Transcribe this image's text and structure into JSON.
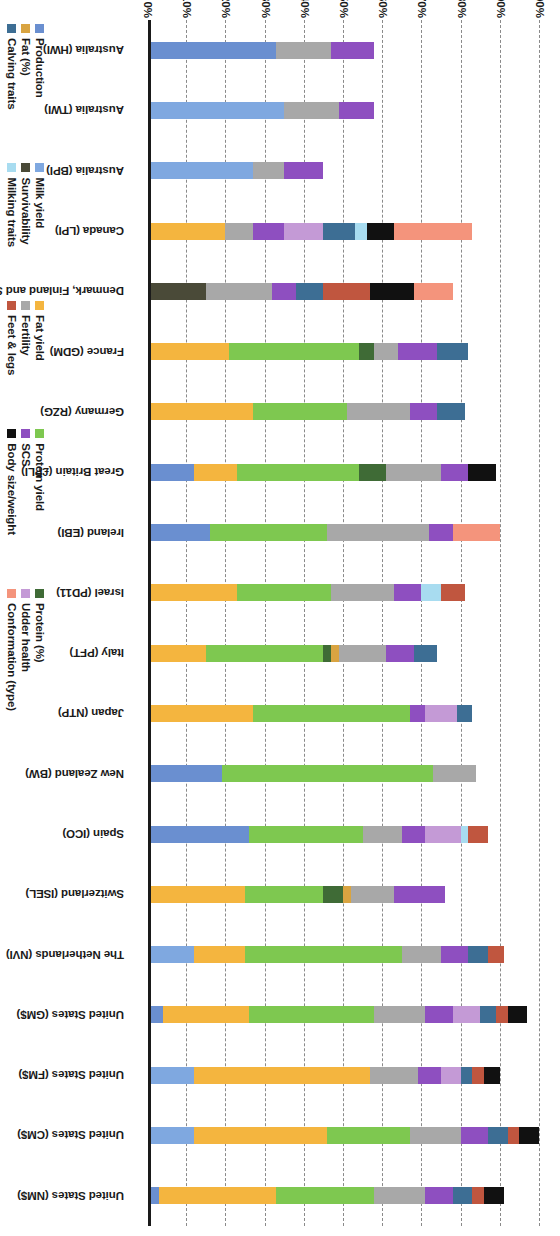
{
  "chart_data": {
    "type": "bar",
    "subtype": "100% stacked bar",
    "title": "",
    "xlabel": "",
    "ylabel": "",
    "ylim": [
      0,
      100
    ],
    "ytick_labels": [
      "0%",
      "10%",
      "20%",
      "30%",
      "40%",
      "50%",
      "60%",
      "70%",
      "80%",
      "90%",
      "100%"
    ],
    "ytick_values": [
      0,
      10,
      20,
      30,
      40,
      50,
      60,
      70,
      80,
      90,
      100
    ],
    "grid": true,
    "legend_position": "bottom",
    "stack_order": [
      "Production",
      "Milk yield",
      "Fat yield",
      "Protein yield",
      "Protein (%)",
      "Fat (%)",
      "Survivability",
      "Fertility",
      "SCS",
      "Udder health",
      "Calving traits",
      "Milking traits",
      "Feet & legs",
      "Body size/weight",
      "Conformation (type)"
    ],
    "colors": {
      "Production": "#6a8fd0",
      "Milk yield": "#7fa8e0",
      "Fat yield": "#f4b53f",
      "Protein yield": "#7ec850",
      "Protein (%)": "#3f6b36",
      "Fat (%)": "#d9a441",
      "Survivability": "#4a4a38",
      "Fertility": "#a8a8a8",
      "SCS": "#8e4fc0",
      "Udder health": "#c49ad6",
      "Calving traits": "#3d6e94",
      "Milking traits": "#a8dcf0",
      "Feet & legs": "#c0563f",
      "Body size/weight": "#111111",
      "Conformation (type)": "#f4947c"
    },
    "categories": [
      "Australia (HWI)",
      "Australia (TWI)",
      "Australia (BPI)",
      "Canada (LPI)",
      "Denmark, Finland and Sweden (NTM)",
      "France (GDM)",
      "Germany (RZG)",
      "Great Britain (£PLI)",
      "Ireland (EBI)",
      "Israel (PD11)",
      "Italy (PFT)",
      "Japan (NTP)",
      "New Zealand (BW)",
      "Spain (ICO)",
      "Switzerland (ISEL)",
      "The Netherlands (NVI)",
      "United States (GM$)",
      "United States (FM$)",
      "United States (CM$)",
      "United States (NM$)"
    ],
    "series": [
      {
        "name": "Production",
        "values": [
          32,
          0,
          0,
          0,
          0,
          0,
          0,
          11,
          15,
          0,
          0,
          0,
          18,
          25,
          0,
          0,
          3,
          0,
          0,
          2
        ]
      },
      {
        "name": "Milk yield",
        "values": [
          0,
          34,
          26,
          0,
          0,
          0,
          0,
          0,
          0,
          0,
          0,
          0,
          0,
          0,
          0,
          11,
          0,
          11,
          11,
          0
        ]
      },
      {
        "name": "Fat yield",
        "values": [
          0,
          0,
          0,
          19,
          0,
          20,
          26,
          11,
          0,
          22,
          14,
          26,
          0,
          0,
          24,
          13,
          22,
          45,
          34,
          30
        ]
      },
      {
        "name": "Protein yield",
        "values": [
          0,
          0,
          0,
          0,
          0,
          33,
          24,
          31,
          30,
          24,
          30,
          40,
          54,
          29,
          20,
          40,
          32,
          0,
          21,
          25
        ]
      },
      {
        "name": "Protein (%)",
        "values": [
          0,
          0,
          0,
          0,
          0,
          4,
          0,
          7,
          0,
          0,
          2,
          0,
          0,
          0,
          5,
          0,
          0,
          0,
          0,
          0
        ]
      },
      {
        "name": "Fat (%)",
        "values": [
          0,
          0,
          0,
          0,
          0,
          0,
          0,
          0,
          0,
          0,
          2,
          0,
          0,
          0,
          2,
          0,
          0,
          0,
          0,
          0
        ]
      },
      {
        "name": "Survivability",
        "values": [
          0,
          0,
          0,
          0,
          14,
          0,
          0,
          0,
          0,
          0,
          0,
          0,
          0,
          0,
          0,
          0,
          0,
          0,
          0,
          0
        ]
      },
      {
        "name": "Fertility",
        "values": [
          14,
          14,
          8,
          7,
          17,
          6,
          16,
          14,
          26,
          16,
          12,
          0,
          11,
          10,
          11,
          10,
          13,
          12,
          13,
          13
        ]
      },
      {
        "name": "SCS",
        "values": [
          11,
          9,
          10,
          8,
          6,
          10,
          7,
          7,
          6,
          7,
          7,
          4,
          0,
          6,
          13,
          7,
          7,
          6,
          7,
          7
        ]
      },
      {
        "name": "Udder health",
        "values": [
          0,
          0,
          0,
          10,
          0,
          0,
          0,
          0,
          0,
          0,
          0,
          8,
          0,
          9,
          0,
          0,
          7,
          5,
          0,
          0
        ]
      },
      {
        "name": "Calving traits",
        "values": [
          0,
          0,
          0,
          8,
          7,
          8,
          7,
          0,
          0,
          0,
          6,
          4,
          0,
          0,
          0,
          5,
          4,
          3,
          5,
          5
        ]
      },
      {
        "name": "Milking traits",
        "values": [
          0,
          0,
          0,
          3,
          0,
          0,
          0,
          0,
          0,
          5,
          0,
          0,
          0,
          2,
          0,
          0,
          0,
          0,
          0,
          0
        ]
      },
      {
        "name": "Feet & legs",
        "values": [
          0,
          0,
          0,
          0,
          12,
          0,
          0,
          0,
          0,
          6,
          0,
          0,
          0,
          5,
          0,
          4,
          3,
          3,
          3,
          3
        ]
      },
      {
        "name": "Body size/weight",
        "values": [
          0,
          0,
          0,
          7,
          11,
          0,
          0,
          7,
          0,
          0,
          0,
          0,
          0,
          0,
          0,
          0,
          5,
          4,
          5,
          5
        ]
      },
      {
        "name": "Conformation (type)",
        "values": [
          0,
          0,
          0,
          20,
          10,
          0,
          0,
          0,
          12,
          0,
          0,
          0,
          0,
          0,
          0,
          0,
          0,
          0,
          0,
          0
        ]
      }
    ]
  },
  "axis": {
    "y_ticks": [
      {
        "value": 0,
        "label": "0%"
      },
      {
        "value": 10,
        "label": "10%"
      },
      {
        "value": 20,
        "label": "20%"
      },
      {
        "value": 30,
        "label": "30%"
      },
      {
        "value": 40,
        "label": "40%"
      },
      {
        "value": 50,
        "label": "50%"
      },
      {
        "value": 60,
        "label": "60%"
      },
      {
        "value": 70,
        "label": "70%"
      },
      {
        "value": 80,
        "label": "80%"
      },
      {
        "value": 90,
        "label": "90%"
      },
      {
        "value": 100,
        "label": "100%"
      }
    ]
  },
  "legend": {
    "columns": [
      {
        "items": [
          {
            "label": "Production",
            "color": "#6a8fd0"
          },
          {
            "label": "Fat (%)",
            "color": "#d9a441"
          },
          {
            "label": "Calving traits",
            "color": "#3d6e94"
          }
        ]
      },
      {
        "items": [
          {
            "label": "Milk yield",
            "color": "#7fa8e0"
          },
          {
            "label": "Survivability",
            "color": "#4a4a38"
          },
          {
            "label": "Milking traits",
            "color": "#a8dcf0"
          }
        ]
      },
      {
        "items": [
          {
            "label": "Fat yield",
            "color": "#f4b53f"
          },
          {
            "label": "Fertility",
            "color": "#a8a8a8"
          },
          {
            "label": "Feet & legs",
            "color": "#c0563f"
          }
        ]
      },
      {
        "items": [
          {
            "label": "Protein yield",
            "color": "#7ec850"
          },
          {
            "label": "SCS",
            "color": "#8e4fc0"
          },
          {
            "label": "Body size/weight",
            "color": "#111111"
          }
        ]
      },
      {
        "items": [
          {
            "label": "Protein (%)",
            "color": "#3f6b36"
          },
          {
            "label": "Udder health",
            "color": "#c49ad6"
          },
          {
            "label": "Conformation (type)",
            "color": "#f4947c"
          }
        ]
      }
    ]
  }
}
